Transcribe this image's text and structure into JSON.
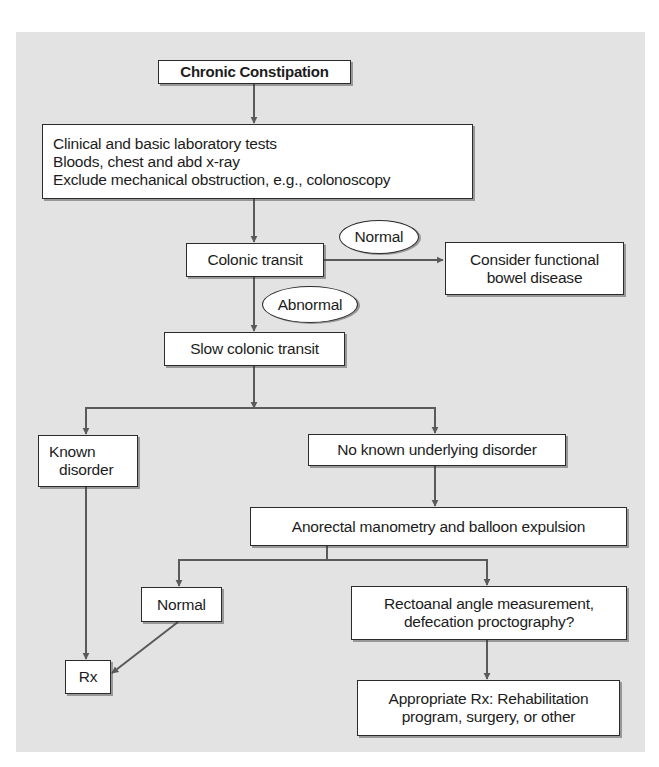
{
  "diagram": {
    "title": "Chronic Constipation",
    "nodes": {
      "start": {
        "label": "Chronic Constipation"
      },
      "initial_tests": {
        "lines": [
          "Clinical and basic laboratory tests",
          "Bloods, chest and abd x-ray",
          "Exclude mechanical obstruction, e.g., colonoscopy"
        ]
      },
      "colonic_transit": {
        "label": "Colonic transit"
      },
      "functional": {
        "lines": [
          "Consider functional",
          "bowel disease"
        ]
      },
      "slow_transit": {
        "label": "Slow colonic transit"
      },
      "known_disorder": {
        "lines": [
          "Known",
          "disorder"
        ]
      },
      "no_known": {
        "label": "No known underlying disorder"
      },
      "anorectal": {
        "label": "Anorectal manometry and balloon expulsion"
      },
      "normal_result": {
        "label": "Normal"
      },
      "rectoanal": {
        "lines": [
          "Rectoanal angle measurement,",
          "defecation proctography?"
        ]
      },
      "rx": {
        "label": "Rx"
      },
      "appropriate_rx": {
        "lines": [
          "Appropriate Rx: Rehabilitation",
          "program, surgery, or other"
        ]
      }
    },
    "edge_labels": {
      "normal": "Normal",
      "abnormal": "Abnormal"
    },
    "edges": [
      {
        "from": "start",
        "to": "initial_tests"
      },
      {
        "from": "initial_tests",
        "to": "colonic_transit"
      },
      {
        "from": "colonic_transit",
        "to": "functional",
        "label": "Normal"
      },
      {
        "from": "colonic_transit",
        "to": "slow_transit",
        "label": "Abnormal"
      },
      {
        "from": "slow_transit",
        "to": "known_disorder"
      },
      {
        "from": "slow_transit",
        "to": "no_known"
      },
      {
        "from": "known_disorder",
        "to": "rx"
      },
      {
        "from": "no_known",
        "to": "anorectal"
      },
      {
        "from": "anorectal",
        "to": "normal_result"
      },
      {
        "from": "anorectal",
        "to": "rectoanal"
      },
      {
        "from": "normal_result",
        "to": "rx"
      },
      {
        "from": "rectoanal",
        "to": "appropriate_rx"
      }
    ],
    "colors": {
      "panel_background": "#e3e3e3",
      "box_fill": "#ffffff",
      "box_border": "#2b2b2b",
      "arrow": "#5a5a5a",
      "text": "#1c1c1c"
    }
  }
}
